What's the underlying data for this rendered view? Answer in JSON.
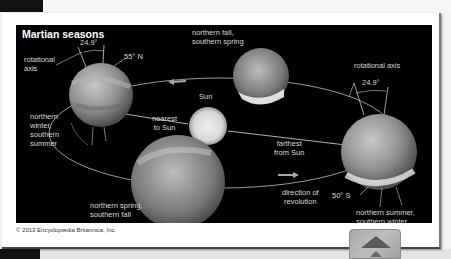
{
  "figure": {
    "title": "Martian seasons",
    "copyright": "© 2013 Encyclopædia Britannica, Inc.",
    "colors": {
      "panel_background": "#000000",
      "label_text": "#d8d8d8",
      "orbit_line": "#bfbfbf",
      "page_background": "#ffffff"
    },
    "labels": {
      "rotational_axis_left": "rotational\naxis",
      "tilt_left": "24.9°",
      "lat_north": "55° N",
      "northern_winter": "northern\nwinter,\nsouthern\nsummer",
      "northern_fall": "northern fall,\nsouthern spring",
      "sun": "Sun",
      "nearest": "nearest\nto Sun",
      "farthest": "farthest\nfrom Sun",
      "rotational_axis_right": "rotational axis",
      "tilt_right": "24.9°",
      "northern_spring": "northern spring,\nsouthern fall",
      "direction": "direction of\nrevolution",
      "lat_south": "50° S",
      "northern_summer": "northern summer,\nsouthern winter"
    },
    "bodies": [
      {
        "name": "Sun",
        "role": "central star"
      },
      {
        "name": "Mars",
        "season": "northern winter, southern summer",
        "position": "left"
      },
      {
        "name": "Mars",
        "season": "northern fall, southern spring",
        "position": "top"
      },
      {
        "name": "Mars",
        "season": "northern summer, southern winter",
        "position": "right"
      },
      {
        "name": "Mars",
        "season": "northern spring, southern fall",
        "position": "bottom"
      }
    ]
  },
  "ui": {
    "scroll_to_top_icon": "triangle-up-icon"
  }
}
